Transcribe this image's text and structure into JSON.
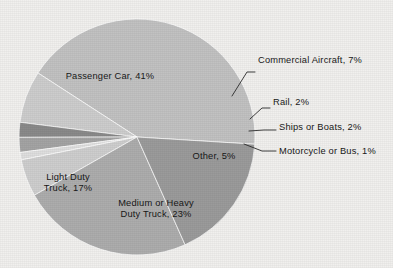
{
  "chart_data": {
    "type": "pie",
    "title": "",
    "subtitle": "",
    "xlabel": "",
    "ylabel": "",
    "legend_position": "none",
    "grid": false,
    "units": "percent",
    "total": 98,
    "categories": [
      "Passenger Car",
      "Commercial Aircraft",
      "Rail",
      "Ships or Boats",
      "Motorcycle or Bus",
      "Other",
      "Medium or Heavy Duty Truck",
      "Light Duty Truck"
    ],
    "values": [
      41,
      7,
      2,
      2,
      1,
      5,
      23,
      17
    ],
    "labels": [
      "Passenger Car, 41%",
      "Commercial Aircraft, 7%",
      "Rail, 2%",
      "Ships or Boats, 2%",
      "Motorcycle or Bus, 1%",
      "Other, 5%",
      "Medium or Heavy Duty Truck, 23%",
      "Light Duty Truck, 17%"
    ],
    "colors": [
      "#c2c2c2",
      "#cdcdcd",
      "#8a8a8a",
      "#a4a4a4",
      "#dedede",
      "#cecece",
      "#adadad",
      "#9b9b9b"
    ],
    "slices": [
      {
        "name": "Passenger Car",
        "value": 41,
        "color": "#c2c2c2",
        "label_placement": "inside"
      },
      {
        "name": "Commercial Aircraft",
        "value": 7,
        "color": "#cdcdcd",
        "label_placement": "outside"
      },
      {
        "name": "Rail",
        "value": 2,
        "color": "#8a8a8a",
        "label_placement": "outside"
      },
      {
        "name": "Ships or Boats",
        "value": 2,
        "color": "#a4a4a4",
        "label_placement": "outside"
      },
      {
        "name": "Motorcycle or Bus",
        "value": 1,
        "color": "#dedede",
        "label_placement": "outside"
      },
      {
        "name": "Other",
        "value": 5,
        "color": "#cecece",
        "label_placement": "inside"
      },
      {
        "name": "Medium or Heavy Duty Truck",
        "value": 23,
        "color": "#adadad",
        "label_placement": "inside"
      },
      {
        "name": "Light Duty Truck",
        "value": 17,
        "color": "#9b9b9b",
        "label_placement": "inside"
      }
    ]
  },
  "labels_inside": {
    "passenger_car": "Passenger Car, 41%",
    "light_duty_truck_line1": "Light Duty",
    "light_duty_truck_line2": "Truck, 17%",
    "medium_heavy_truck_line1": "Medium or Heavy",
    "medium_heavy_truck_line2": "Duty Truck, 23%",
    "other": "Other, 5%"
  },
  "labels_outside": {
    "commercial_aircraft": "Commercial Aircraft, 7%",
    "rail": "Rail, 2%",
    "ships_or_boats": "Ships or Boats, 2%",
    "motorcycle_or_bus": "Motorcycle or Bus, 1%"
  },
  "style": {
    "background": "#f1f0ee",
    "text_color": "#181818",
    "leader_color": "#2b2b2b"
  }
}
